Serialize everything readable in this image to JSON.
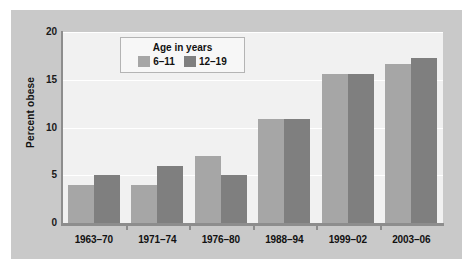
{
  "chart_data": {
    "type": "bar",
    "title": "",
    "xlabel": "",
    "ylabel": "Percent obese",
    "ylim": [
      0,
      20
    ],
    "yticks": [
      "0",
      "5",
      "10",
      "15",
      "20"
    ],
    "grid": true,
    "legend_position": "top-left-inside",
    "legend_title": "Age in years",
    "categories": [
      "1963–70",
      "1971–74",
      "1976–80",
      "1988–94",
      "1999–02",
      "2003–06"
    ],
    "series": [
      {
        "name": "6–11",
        "color": "#a6a6a6",
        "values": [
          4.0,
          4.0,
          7.0,
          10.9,
          15.6,
          16.7
        ]
      },
      {
        "name": "12–19",
        "color": "#7f7f7f",
        "values": [
          5.0,
          6.0,
          5.0,
          10.9,
          15.6,
          17.3
        ]
      }
    ]
  },
  "colors": {
    "series_light": "#a6a6a6",
    "series_dark": "#7f7f7f",
    "figure_background": "#c9c9c9",
    "plot_background": "#f1f1f1",
    "axis": "#8d8d8d",
    "gridline": "#ffffff"
  }
}
